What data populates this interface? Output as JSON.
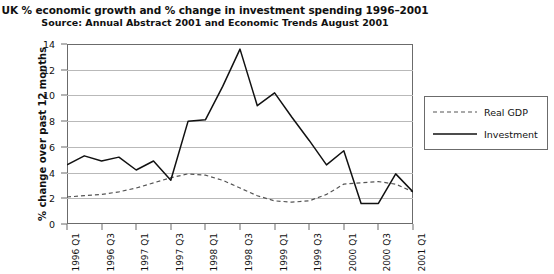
{
  "chart_data": {
    "type": "line",
    "title": "UK % economic growth and % change in investment spending 1996–2001",
    "subtitle": "Source: Annual Abstract 2001 and Economic Trends August 2001",
    "xlabel": "",
    "ylabel": "% change over past 12 months",
    "ylim": [
      0,
      14
    ],
    "yticks": [
      0,
      2,
      4,
      6,
      8,
      10,
      12,
      14
    ],
    "ytick_labels": [
      "0",
      "2",
      "4",
      "6",
      "8",
      "10",
      "12",
      "14"
    ],
    "grid": true,
    "legend_position": "right-outside",
    "x": [
      "1996 Q1",
      "1996 Q2",
      "1996 Q3",
      "1996 Q4",
      "1997 Q1",
      "1997 Q2",
      "1997 Q3",
      "1997 Q4",
      "1998 Q1",
      "1998 Q2",
      "1998 Q3",
      "1998 Q4",
      "1999 Q1",
      "1999 Q2",
      "1999 Q3",
      "1999 Q4",
      "2000 Q1",
      "2000 Q2",
      "2000 Q3",
      "2000 Q4",
      "2001 Q1"
    ],
    "xtick_labels": [
      "1996 Q1",
      "1996 Q3",
      "1997 Q1",
      "1997 Q3",
      "1998 Q1",
      "1998 Q3",
      "1999 Q1",
      "1999 Q3",
      "2000 Q1",
      "2000 Q3",
      "2001 Q1"
    ],
    "xtick_indices": [
      0,
      2,
      4,
      6,
      8,
      10,
      12,
      14,
      16,
      18,
      20
    ],
    "series": [
      {
        "name": "Real GDP",
        "style": "dashed",
        "color": "#555555",
        "values": [
          2.1,
          2.2,
          2.3,
          2.5,
          2.8,
          3.2,
          3.6,
          3.9,
          3.8,
          3.4,
          2.8,
          2.2,
          1.8,
          1.7,
          1.8,
          2.3,
          3.1,
          3.2,
          3.3,
          3.1,
          2.5
        ]
      },
      {
        "name": "Investment",
        "style": "solid",
        "color": "#111111",
        "values": [
          4.6,
          5.3,
          4.9,
          5.2,
          4.2,
          4.9,
          3.4,
          8.0,
          8.1,
          10.7,
          13.6,
          9.2,
          10.2,
          8.3,
          6.5,
          4.6,
          5.7,
          1.6,
          1.6,
          3.9,
          2.5
        ]
      }
    ]
  },
  "legend": {
    "items": [
      {
        "label": "Real GDP"
      },
      {
        "label": "Investment"
      }
    ]
  }
}
